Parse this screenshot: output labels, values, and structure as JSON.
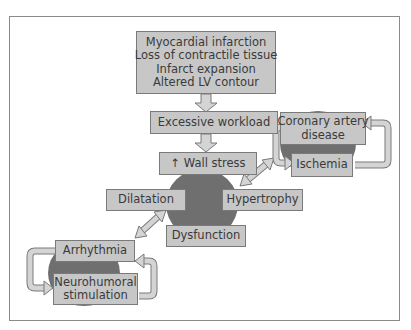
{
  "diagram": {
    "type": "flowchart",
    "colors": {
      "box_fill": "#c7c7c7",
      "box_border": "#7a7a7a",
      "circle_fill": "#6f6f6f",
      "arrow_fill": "#d4d4d4",
      "arrow_stroke": "#7a7a7a",
      "text": "#3a3a3a"
    },
    "nodes": {
      "origin": {
        "lines": [
          "Myocardial infarction",
          "Loss of contractile tissue",
          "Infarct expansion",
          "Altered LV contour"
        ]
      },
      "workload": {
        "label": "Excessive workload"
      },
      "wall_stress": {
        "label": "↑ Wall stress"
      },
      "dilatation": {
        "label": "Dilatation"
      },
      "hypertrophy": {
        "label": "Hypertrophy"
      },
      "dysfunction": {
        "label": "Dysfunction"
      },
      "cad": {
        "lines": [
          "Coronary artery",
          "disease"
        ]
      },
      "ischemia": {
        "label": "Ischemia"
      },
      "arrhythmia": {
        "label": "Arrhythmia"
      },
      "neurohumoral": {
        "lines": [
          "Neurohumoral",
          "stimulation"
        ]
      }
    },
    "edges": [
      {
        "from": "origin",
        "to": "workload",
        "type": "down-arrow"
      },
      {
        "from": "workload",
        "to": "wall_stress",
        "type": "down-arrow"
      },
      {
        "from": "hypertrophy",
        "to": "cad-ischemia-loop",
        "type": "double-arrow"
      },
      {
        "from": "dilatation",
        "to": "arrhythmia-neurohumoral-loop",
        "type": "double-arrow"
      },
      {
        "from": "ischemia",
        "to": "cad",
        "type": "loop-arrow"
      },
      {
        "from": "cad",
        "to": "ischemia",
        "type": "loop-arrow"
      },
      {
        "from": "neurohumoral",
        "to": "arrhythmia",
        "type": "loop-arrow"
      },
      {
        "from": "arrhythmia",
        "to": "neurohumoral",
        "type": "loop-arrow"
      }
    ]
  }
}
